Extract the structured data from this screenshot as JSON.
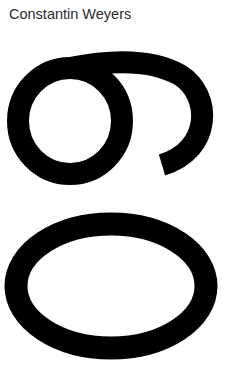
{
  "card": {
    "designer_name": "Constantin Weyers",
    "specimen_text": "60",
    "specimen_rotation_deg": 90,
    "text_color": "#2b2b2b",
    "glyph_color": "#000000",
    "background": "#ffffff"
  }
}
